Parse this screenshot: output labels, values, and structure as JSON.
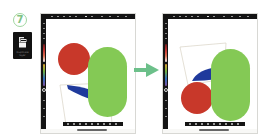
{
  "step": {
    "number": "7",
    "badge_color": "#7fc384"
  },
  "tool_tile": {
    "icon": "layers-copy-icon",
    "label": "Duplicate layer",
    "background": "#111111"
  },
  "transition_arrow": {
    "icon": "arrow-right-icon",
    "color": "#6cc08a"
  },
  "frames": [
    {
      "id": "before",
      "description": "Canvas before: red circle top-left, green pill right, blue wedge and outlined quadrilateral lower-left",
      "shapes": [
        {
          "type": "circle",
          "color": "#c8382a",
          "name": "red-circle"
        },
        {
          "type": "pill",
          "color": "#84c955",
          "name": "green-pill"
        },
        {
          "type": "wedge",
          "color": "#1f3a9c",
          "name": "blue-wedge"
        },
        {
          "type": "outline-quad",
          "color": "#d9d3c4",
          "name": "outline-quad"
        }
      ]
    },
    {
      "id": "after",
      "description": "Canvas after: outlined quadrilateral and blue wedge top-left, red circle bottom-left, green pill right",
      "shapes": [
        {
          "type": "outline-quad",
          "color": "#d9d3c4",
          "name": "outline-quad"
        },
        {
          "type": "wedge",
          "color": "#1f3a9c",
          "name": "blue-wedge"
        },
        {
          "type": "circle",
          "color": "#c8382a",
          "name": "red-circle"
        },
        {
          "type": "pill",
          "color": "#84c955",
          "name": "green-pill"
        }
      ]
    }
  ],
  "colors": {
    "toolbar": "#141414",
    "canvas": "#ffffff",
    "red": "#c8382a",
    "green": "#84c955",
    "blue": "#1f3a9c"
  }
}
